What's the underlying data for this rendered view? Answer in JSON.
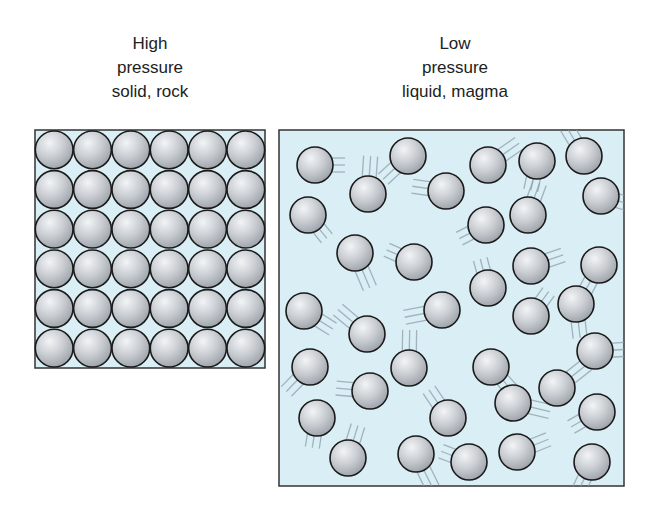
{
  "panels": [
    {
      "id": "solid",
      "title_lines": [
        "High",
        "pressure",
        "solid, rock"
      ],
      "box": {
        "x": 35,
        "y": 130,
        "w": 230,
        "h": 238
      },
      "arrangement": "grid",
      "rows": 6,
      "cols": 6
    },
    {
      "id": "liquid",
      "title_lines": [
        "Low",
        "pressure",
        "liquid, magma"
      ],
      "box": {
        "x": 279,
        "y": 130,
        "w": 345,
        "h": 356
      },
      "arrangement": "random",
      "particles": [
        [
          315,
          165
        ],
        [
          408,
          156
        ],
        [
          368,
          194
        ],
        [
          308,
          215
        ],
        [
          446,
          191
        ],
        [
          488,
          165
        ],
        [
          537,
          161
        ],
        [
          584,
          156
        ],
        [
          601,
          196
        ],
        [
          486,
          225
        ],
        [
          528,
          215
        ],
        [
          355,
          253
        ],
        [
          414,
          262
        ],
        [
          531,
          266
        ],
        [
          599,
          265
        ],
        [
          488,
          288
        ],
        [
          304,
          311
        ],
        [
          442,
          310
        ],
        [
          531,
          316
        ],
        [
          576,
          304
        ],
        [
          367,
          334
        ],
        [
          595,
          351
        ],
        [
          310,
          367
        ],
        [
          409,
          368
        ],
        [
          491,
          367
        ],
        [
          370,
          391
        ],
        [
          557,
          388
        ],
        [
          317,
          418
        ],
        [
          448,
          418
        ],
        [
          513,
          403
        ],
        [
          597,
          412
        ],
        [
          348,
          458
        ],
        [
          416,
          454
        ],
        [
          469,
          462
        ],
        [
          517,
          452
        ],
        [
          592,
          462
        ]
      ]
    }
  ],
  "colors": {
    "box_fill": "#d9eef5",
    "box_border": "#333333",
    "particle_fill": "#c9cdd2",
    "particle_stroke": "#1a1a1a",
    "motion_lines": "#8a9aa6"
  }
}
